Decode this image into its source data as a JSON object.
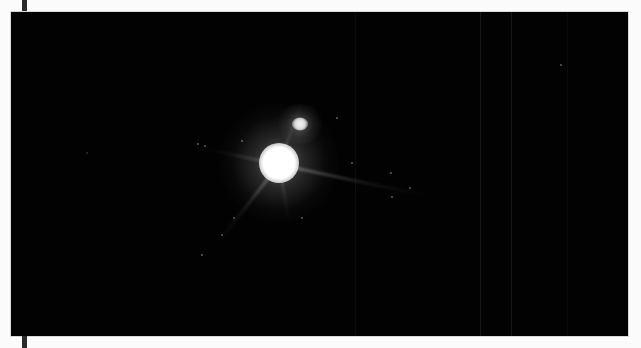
{
  "image": {
    "subject": "binary star system (bright primary with faint companion)",
    "background_color": "#020202",
    "primary_star": {
      "cx": 268,
      "cy": 151,
      "core_color": "#ffffff"
    },
    "companion_star": {
      "cx": 289,
      "cy": 112,
      "core_color": "#f4f4f4"
    }
  }
}
